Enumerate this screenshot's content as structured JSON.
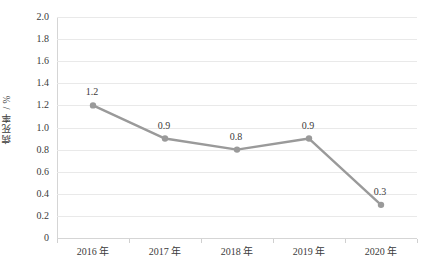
{
  "chart_data": {
    "type": "line",
    "title": "",
    "subtitle": "",
    "xlabel": "",
    "ylabel": "病死率 / %",
    "categories": [
      "2016 年",
      "2017 年",
      "2018 年",
      "2019 年",
      "2020 年"
    ],
    "values": [
      1.2,
      0.9,
      0.8,
      0.9,
      0.3
    ],
    "point_labels": [
      "1.2",
      "0.9",
      "0.8",
      "0.9",
      "0.3"
    ],
    "series": [
      {
        "name": "病死率",
        "values": [
          1.2,
          0.9,
          0.8,
          0.9,
          0.3
        ]
      }
    ],
    "ylim": [
      0,
      2.0
    ],
    "ytick_values": [
      2.0,
      1.8,
      1.6,
      1.4,
      1.2,
      1.0,
      0.8,
      0.6,
      0.4,
      0.2,
      0
    ],
    "ytick_labels": [
      "2.0",
      "1.8",
      "1.6",
      "1.4",
      "1.2",
      "1.0",
      "0.8",
      "0.6",
      "0.4",
      "0.2",
      "0"
    ],
    "grid": "horizontal",
    "legend": "none",
    "line_color": "#9a9a9a",
    "marker_color": "#9a9a9a",
    "grid_color": "#e9e9e9",
    "axis_color": "#d5d5d5",
    "text_color": "#3b3b3b"
  }
}
